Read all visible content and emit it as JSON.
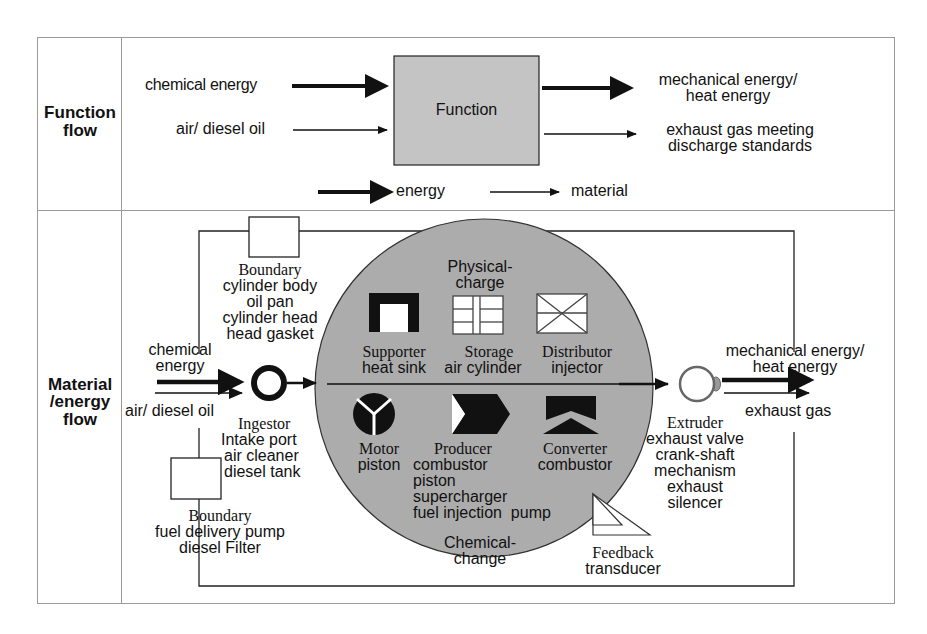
{
  "table": {
    "rows": [
      {
        "label_lines": [
          "Function",
          "flow"
        ]
      },
      {
        "label_lines": [
          "Material",
          "/energy",
          "flow"
        ]
      }
    ]
  },
  "function_flow": {
    "inputs": [
      {
        "label": "chemical energy",
        "type": "energy"
      },
      {
        "label": "air/ diesel oil",
        "type": "material"
      }
    ],
    "box_label": "Function",
    "outputs": [
      {
        "label_lines": [
          "mechanical energy/",
          "heat energy"
        ],
        "type": "energy"
      },
      {
        "label_lines": [
          "exhaust gas  meeting",
          "discharge standards"
        ],
        "type": "material"
      }
    ],
    "legend": [
      {
        "label": "energy",
        "type": "energy"
      },
      {
        "label": "material",
        "type": "material"
      }
    ]
  },
  "material_flow": {
    "inputs": [
      {
        "label_lines": [
          "chemical",
          "energy"
        ],
        "type": "energy"
      },
      {
        "label": "air/ diesel oil",
        "type": "material"
      }
    ],
    "boundary_top": {
      "title": "Boundary",
      "items": [
        "cylinder body",
        "oil pan",
        "cylinder head",
        "head gasket"
      ]
    },
    "boundary_bottom": {
      "title": "Boundary",
      "items": [
        "fuel delivery pump",
        "diesel Filter"
      ]
    },
    "ingestor": {
      "title": "Ingestor",
      "items": [
        "Intake  port",
        "air cleaner",
        "diesel tank"
      ]
    },
    "circle": {
      "top_caption_lines": [
        "Physical-",
        "charge"
      ],
      "bottom_caption_lines": [
        "Chemical-",
        "change"
      ],
      "upper_components": [
        {
          "icon": "supporter-icon",
          "title": "Supporter",
          "items": [
            "heat sink"
          ]
        },
        {
          "icon": "storage-icon",
          "title": "Storage",
          "items": [
            "air cylinder"
          ]
        },
        {
          "icon": "distributor-icon",
          "title": "Distributor",
          "items": [
            "injector"
          ]
        }
      ],
      "lower_components": [
        {
          "icon": "motor-icon",
          "title": "Motor",
          "items": [
            "piston"
          ]
        },
        {
          "icon": "producer-icon",
          "title": "Producer",
          "items": [
            "combustor",
            "piston",
            "supercharger",
            "fuel injection  pump"
          ]
        },
        {
          "icon": "converter-icon",
          "title": "Converter",
          "items": [
            "combustor"
          ]
        }
      ]
    },
    "feedback": {
      "title": "Feedback",
      "items": [
        "transducer"
      ]
    },
    "extruder": {
      "title": "Extruder",
      "items": [
        "exhaust valve",
        "crank-shaft",
        "mechanism",
        "exhaust",
        "silencer"
      ]
    },
    "outputs": [
      {
        "label_lines": [
          "mechanical energy/",
          "heat energy"
        ],
        "type": "energy"
      },
      {
        "label": "exhaust gas",
        "type": "material"
      }
    ]
  },
  "colors": {
    "circle_fill": "#acacac",
    "function_box_fill": "#c4c4c4",
    "line": "#111111",
    "table_border": "#9a9a9a"
  }
}
